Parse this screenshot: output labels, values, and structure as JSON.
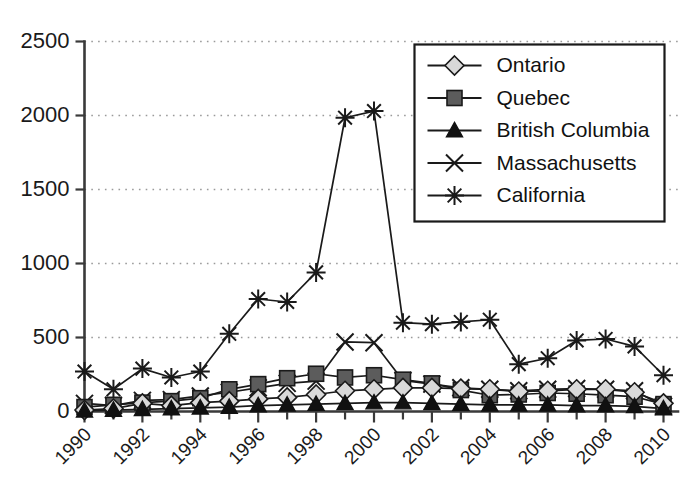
{
  "chart_data": {
    "type": "line",
    "title": "",
    "xlabel": "",
    "ylabel": "",
    "xlim": [
      1990,
      2010
    ],
    "ylim": [
      0,
      2500
    ],
    "yticks": [
      0,
      500,
      1000,
      1500,
      2000,
      2500
    ],
    "ytick_labels": [
      "0",
      "500",
      "1000",
      "1500",
      "2000",
      "2500"
    ],
    "x": [
      1990,
      1991,
      1992,
      1993,
      1994,
      1995,
      1996,
      1997,
      1998,
      1999,
      2000,
      2001,
      2002,
      2003,
      2004,
      2005,
      2006,
      2007,
      2008,
      2009,
      2010
    ],
    "xtick_labels": [
      "1990",
      "1992",
      "1994",
      "1996",
      "1998",
      "2000",
      "2002",
      "2004",
      "2006",
      "2008",
      "2010"
    ],
    "xtick_values": [
      1990,
      1992,
      1994,
      1996,
      1998,
      2000,
      2002,
      2004,
      2006,
      2008,
      2010
    ],
    "minor_xticks": [
      1991,
      1993,
      1995,
      1997,
      1999,
      2001,
      2003,
      2005,
      2007,
      2009
    ],
    "grid": "horizontal-dotted",
    "legend_position": "top-right",
    "series": [
      {
        "name": "Ontario",
        "marker": "diamond",
        "marker_fill": "#d9d9d9",
        "values": [
          10,
          20,
          55,
          40,
          60,
          70,
          85,
          95,
          115,
          140,
          150,
          160,
          160,
          155,
          150,
          135,
          140,
          150,
          150,
          130,
          55
        ]
      },
      {
        "name": "Quebec",
        "marker": "square",
        "marker_fill": "#5c5c5c",
        "values": [
          30,
          45,
          60,
          70,
          90,
          150,
          185,
          225,
          255,
          230,
          245,
          215,
          190,
          145,
          110,
          115,
          125,
          120,
          110,
          100,
          50
        ]
      },
      {
        "name": "British Columbia",
        "marker": "triangle",
        "marker_fill": "#111111",
        "values": [
          5,
          10,
          15,
          20,
          25,
          30,
          40,
          45,
          50,
          55,
          60,
          60,
          55,
          50,
          45,
          45,
          45,
          40,
          40,
          35,
          20
        ]
      },
      {
        "name": "Massachusetts",
        "marker": "cross",
        "marker_fill": "none",
        "values": [
          55,
          40,
          75,
          80,
          105,
          130,
          160,
          190,
          205,
          470,
          465,
          210,
          185,
          160,
          150,
          140,
          150,
          155,
          150,
          140,
          35
        ]
      },
      {
        "name": "California",
        "marker": "asterisk",
        "marker_fill": "none",
        "values": [
          270,
          150,
          290,
          230,
          270,
          525,
          760,
          740,
          940,
          1985,
          2030,
          600,
          590,
          605,
          620,
          320,
          360,
          480,
          490,
          440,
          245
        ]
      }
    ]
  },
  "legend": {
    "items": [
      {
        "label": "Ontario"
      },
      {
        "label": "Quebec"
      },
      {
        "label": "British Columbia"
      },
      {
        "label": "Massachusetts"
      },
      {
        "label": "California"
      }
    ]
  }
}
